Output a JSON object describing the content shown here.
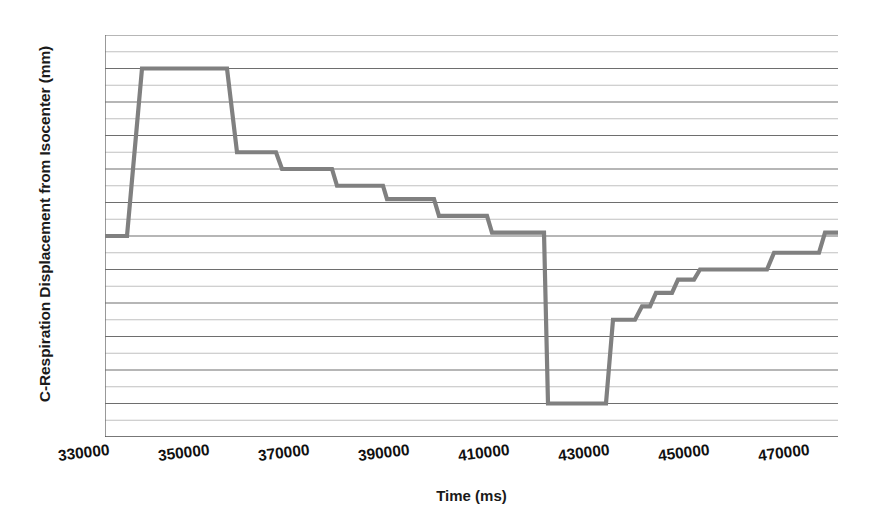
{
  "chart_data": {
    "type": "line",
    "title": "",
    "subtitle": "",
    "xlabel": "Time  (ms)",
    "ylabel": "C-Respiration Displacement from Isocenter (mm)",
    "xlim": [
      330000,
      476600
    ],
    "ylim": [
      -60,
      60
    ],
    "xticks": [
      330000,
      350000,
      370000,
      390000,
      410000,
      430000,
      450000,
      470000
    ],
    "xtick_labels": [
      "330000",
      "350000",
      "370000",
      "390000",
      "410000",
      "430000",
      "450000",
      "470000"
    ],
    "yticks": [
      -60,
      -50,
      -40,
      -30,
      -20,
      -10,
      0,
      10,
      20,
      30,
      40,
      50,
      60
    ],
    "ytick_labels": [
      "-60",
      "-50",
      "-40",
      "-30",
      "-20",
      "-10",
      "0",
      "10",
      "20",
      "30",
      "40",
      "50",
      "60"
    ],
    "minor_ytick_step": 5,
    "grid": "horizontal-major-and-minor",
    "legend": "none",
    "series_color": "#808080",
    "series": [
      {
        "name": "C-Respiration Displacement",
        "x": [
          330000,
          334200,
          334400,
          337400,
          337600,
          354200,
          354400,
          356400,
          356600,
          364000,
          364200,
          365400,
          365600,
          375200,
          375400,
          376400,
          376600,
          385400,
          385600,
          386400,
          386600,
          395600,
          395800,
          396800,
          397000,
          406200,
          406400,
          407400,
          407600,
          417600,
          417800,
          418600,
          418800,
          419400,
          419600,
          420800,
          421000,
          422600,
          422800,
          424000,
          424200,
          425400,
          425600,
          427000,
          427200,
          428400,
          428600,
          430000,
          430200,
          431600,
          431800,
          433000,
          433200,
          434400,
          434600,
          435800,
          436000,
          437400,
          437600,
          438800,
          439000,
          440200,
          440400,
          441800,
          442000,
          443200,
          443400,
          444600,
          444800,
          446200,
          446400,
          447600,
          447800,
          449000,
          449200,
          450600,
          450800,
          452000,
          452200,
          453400,
          453600,
          455000,
          455200,
          456400,
          456600,
          457800,
          458000,
          459400,
          459600,
          460800,
          461000,
          462200,
          462400,
          463800,
          464000,
          465200,
          465400,
          466600,
          466800,
          468200,
          468400,
          469600,
          469800,
          471000,
          471200,
          472600,
          472800,
          474000,
          474200,
          475400,
          475600,
          476600
        ],
        "y": [
          0,
          0,
          0,
          50,
          50,
          50,
          50,
          25,
          25,
          25,
          25,
          20,
          20,
          20,
          20,
          15,
          15,
          15,
          15,
          11,
          11,
          11,
          11,
          6,
          6,
          6,
          6,
          1,
          1,
          1,
          1,
          -50,
          -50,
          -50,
          -50,
          -50,
          -50,
          -50,
          -50,
          -50,
          -50,
          -50,
          -50,
          -50,
          -50,
          -50,
          -50,
          -50,
          -50,
          -25,
          -25,
          -25,
          -25,
          -25,
          -25,
          -25,
          -25,
          -21,
          -21,
          -21,
          -21,
          -17,
          -17,
          -17,
          -17,
          -17,
          -17,
          -13,
          -13,
          -13,
          -13,
          -13,
          -13,
          -10,
          -10,
          -10,
          -10,
          -10,
          -10,
          -10,
          -10,
          -10,
          -10,
          -10,
          -10,
          -10,
          -10,
          -10,
          -10,
          -10,
          -10,
          -10,
          -10,
          -5,
          -5,
          -5,
          -5,
          -5,
          -5,
          -5,
          -5,
          -5,
          -5,
          -5,
          -5,
          -5,
          -5,
          1,
          1,
          1,
          1,
          1
        ],
        "step_levels_mm": [
          0,
          50,
          25,
          20,
          15,
          11,
          6,
          1,
          -50,
          -25,
          -21,
          -17,
          -13,
          -10,
          -5,
          1
        ]
      }
    ]
  }
}
